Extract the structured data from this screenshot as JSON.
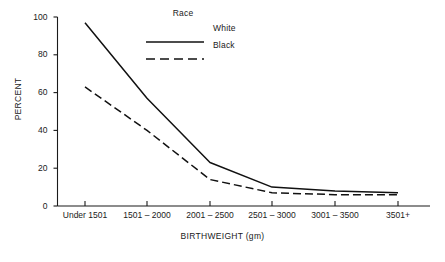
{
  "chart_data": {
    "type": "line",
    "title": "",
    "xlabel": "BIRTHWEIGHT (gm)",
    "ylabel": "PERCENT",
    "categories": [
      "Under 1501",
      "1501 – 2000",
      "2001 – 2500",
      "2501 – 3000",
      "3001 – 3500",
      "3501+"
    ],
    "series": [
      {
        "name": "White",
        "style": "solid",
        "values": [
          97,
          57,
          23,
          10,
          8,
          7
        ]
      },
      {
        "name": "Black",
        "style": "dashed",
        "values": [
          63,
          40,
          14,
          7,
          6,
          6
        ]
      }
    ],
    "ylim": [
      0,
      100
    ],
    "yticks": [
      0,
      20,
      40,
      60,
      80,
      100
    ],
    "ytick_labels": [
      "0",
      "20",
      "40",
      "60",
      "80",
      "100"
    ],
    "grid": false,
    "legend_position": "top-center",
    "legend_title": "Race",
    "line_color": "#111111"
  },
  "axes": {
    "y_title": "PERCENT",
    "x_title": "BIRTHWEIGHT (gm)",
    "y_labels": [
      "100",
      "80",
      "60",
      "40",
      "20",
      "0"
    ],
    "x_labels": [
      "Under 1501",
      "1501 – 2000",
      "2001 – 2500",
      "2501 – 3000",
      "3001 – 3500",
      "3501+"
    ]
  },
  "legend": {
    "title": "Race",
    "entries": [
      {
        "label": "White",
        "style": "solid"
      },
      {
        "label": "Black",
        "style": "dashed"
      }
    ]
  }
}
